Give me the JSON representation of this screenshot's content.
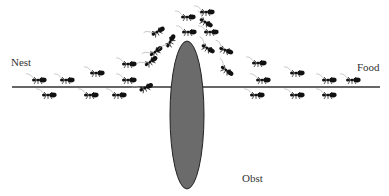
{
  "labels": {
    "nest": "Nest",
    "food": "Food",
    "obstacle": "Obst"
  },
  "colors": {
    "path_line": "#333333",
    "obstacle_fill": "#6b6b6b",
    "ant": "#111111"
  },
  "ants": [
    {
      "x": 38,
      "y": 80,
      "r": 0
    },
    {
      "x": 66,
      "y": 80,
      "r": 0
    },
    {
      "x": 96,
      "y": 73,
      "r": 0
    },
    {
      "x": 128,
      "y": 64,
      "r": 0
    },
    {
      "x": 128,
      "y": 80,
      "r": 0
    },
    {
      "x": 48,
      "y": 95,
      "r": 0
    },
    {
      "x": 90,
      "y": 95,
      "r": 0
    },
    {
      "x": 118,
      "y": 95,
      "r": 0
    },
    {
      "x": 145,
      "y": 88,
      "r": -25
    },
    {
      "x": 150,
      "y": 62,
      "r": -35
    },
    {
      "x": 155,
      "y": 52,
      "r": -35
    },
    {
      "x": 157,
      "y": 32,
      "r": -30
    },
    {
      "x": 170,
      "y": 42,
      "r": -60
    },
    {
      "x": 187,
      "y": 17,
      "r": 0
    },
    {
      "x": 205,
      "y": 22,
      "r": 30
    },
    {
      "x": 188,
      "y": 32,
      "r": 0
    },
    {
      "x": 207,
      "y": 48,
      "r": 30
    },
    {
      "x": 225,
      "y": 50,
      "r": 20
    },
    {
      "x": 226,
      "y": 70,
      "r": 35
    },
    {
      "x": 258,
      "y": 63,
      "r": 0
    },
    {
      "x": 262,
      "y": 80,
      "r": 0
    },
    {
      "x": 296,
      "y": 73,
      "r": 0
    },
    {
      "x": 328,
      "y": 80,
      "r": 0
    },
    {
      "x": 352,
      "y": 80,
      "r": 0
    },
    {
      "x": 256,
      "y": 95,
      "r": 0
    },
    {
      "x": 296,
      "y": 95,
      "r": 0
    },
    {
      "x": 328,
      "y": 95,
      "r": 0
    },
    {
      "x": 206,
      "y": 12,
      "r": 0
    },
    {
      "x": 210,
      "y": 32,
      "r": 0
    }
  ]
}
